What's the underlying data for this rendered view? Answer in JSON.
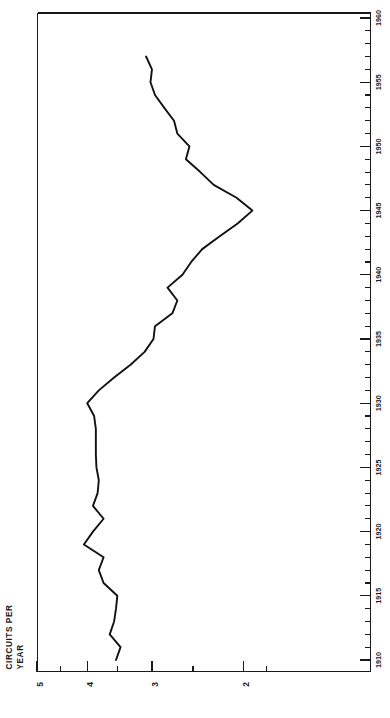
{
  "chart_data": {
    "type": "line",
    "title": "",
    "subtitle": "",
    "orientation": "rotated-90-ccw",
    "ylabel": "CIRCUITS PER YEAR",
    "xlabel": "",
    "yscale": "log",
    "ylim": [
      1.68,
      5.0
    ],
    "xlim": [
      1909,
      1960
    ],
    "grid": false,
    "legend": null,
    "ytick_labels": [
      "5",
      "4",
      "3",
      "2"
    ],
    "ytick_values": [
      5,
      4,
      3,
      2
    ],
    "yminor_values": [
      4.5,
      3.5,
      2.5,
      1.8
    ],
    "xtick_labels": [
      "1910",
      "1915",
      "1920",
      "1925",
      "1930",
      "1935",
      "1940",
      "1945",
      "1950",
      "1955",
      "1960"
    ],
    "xtick_values": [
      1910,
      1915,
      1920,
      1925,
      1930,
      1935,
      1940,
      1945,
      1950,
      1955,
      1960
    ],
    "x": [
      1910,
      1911,
      1912,
      1913,
      1914,
      1915,
      1916,
      1917,
      1918,
      1919,
      1920,
      1921,
      1922,
      1923,
      1924,
      1925,
      1926,
      1927,
      1928,
      1929,
      1930,
      1931,
      1932,
      1933,
      1934,
      1935,
      1936,
      1937,
      1938,
      1939,
      1940,
      1941,
      1942,
      1943,
      1944,
      1945,
      1946,
      1947,
      1948,
      1949,
      1950,
      1951,
      1952,
      1953,
      1954,
      1955,
      1956,
      1957
    ],
    "values": [
      3.52,
      3.45,
      3.62,
      3.55,
      3.52,
      3.5,
      3.72,
      3.8,
      3.72,
      4.06,
      3.9,
      3.72,
      3.9,
      3.82,
      3.8,
      3.84,
      3.85,
      3.85,
      3.85,
      3.88,
      4.0,
      3.8,
      3.55,
      3.3,
      3.1,
      2.98,
      2.96,
      2.74,
      2.68,
      2.8,
      2.62,
      2.52,
      2.4,
      2.22,
      2.05,
      1.92,
      2.06,
      2.28,
      2.42,
      2.58,
      2.54,
      2.68,
      2.72,
      2.84,
      2.96,
      3.02,
      3.0,
      3.08
    ],
    "series_name": "circuits per year",
    "annotations": []
  },
  "axis_title_lines": [
    "CIRCUITS PER",
    "YEAR"
  ]
}
